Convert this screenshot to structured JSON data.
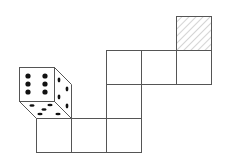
{
  "diagram": {
    "line_color": "#555555",
    "pip_color": "#111111",
    "hatch_color": "#aaaaaa",
    "cell_size": 35,
    "cells": [
      {
        "id": "c1",
        "x": 36,
        "y": 118
      },
      {
        "id": "c2",
        "x": 71,
        "y": 118
      },
      {
        "id": "c3",
        "x": 106,
        "y": 118
      },
      {
        "id": "c4",
        "x": 106,
        "y": 84
      },
      {
        "id": "c5",
        "x": 106,
        "y": 50
      },
      {
        "id": "c6",
        "x": 141,
        "y": 50
      },
      {
        "id": "c7",
        "x": 176,
        "y": 50
      }
    ],
    "target_cell": {
      "id": "hatched",
      "x": 176,
      "y": 16,
      "pattern": "diagonal-hatch"
    },
    "die": {
      "front_face_value": 6,
      "right_face_value": 4,
      "bottom_face_value": 5
    }
  }
}
